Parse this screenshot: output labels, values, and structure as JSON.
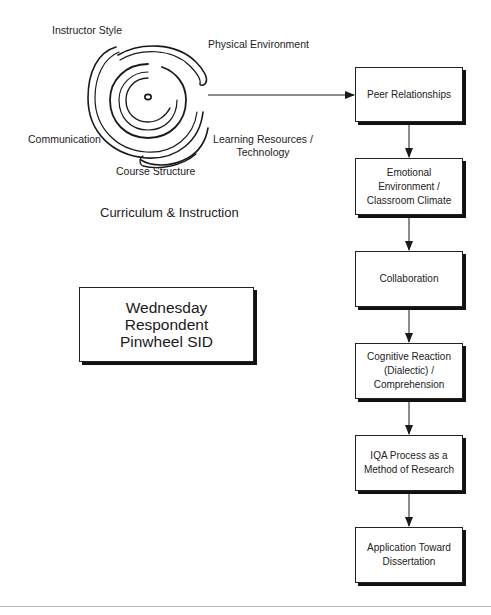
{
  "pinwheel": {
    "labels": {
      "instructor_style": "Instructor Style",
      "physical_environment": "Physical Environment",
      "communication": "Communication",
      "learning_resources": "Learning Resources /\nTechnology",
      "course_structure": "Course Structure"
    },
    "group_title": "Curriculum & Instruction"
  },
  "title_box": {
    "text": "Wednesday\nRespondent\nPinwheel SID"
  },
  "flow": {
    "boxes": [
      {
        "id": "peer",
        "label": "Peer Relationships"
      },
      {
        "id": "emotional",
        "label": "Emotional\nEnvironment /\nClassroom Climate"
      },
      {
        "id": "collaboration",
        "label": "Collaboration"
      },
      {
        "id": "cognitive",
        "label": "Cognitive Reaction\n(Dialectic) /\nComprehension"
      },
      {
        "id": "iqa",
        "label": "IQA Process as a\nMethod of Research"
      },
      {
        "id": "application",
        "label": "Application Toward\nDissertation"
      }
    ]
  },
  "colors": {
    "line": "#1a1a1a",
    "box_border": "#222222",
    "shadow": "#111111",
    "rule": "#bdbdbd"
  }
}
